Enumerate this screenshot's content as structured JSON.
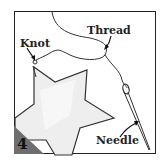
{
  "step_number": "4",
  "labels": {
    "thread": "Thread",
    "knot": "Knot",
    "needle": "Needle"
  },
  "colors": {
    "frame": "#222222",
    "step_badge": "#6e6e6e",
    "fabric_fill": "#eeeeee",
    "line": "#333333"
  }
}
